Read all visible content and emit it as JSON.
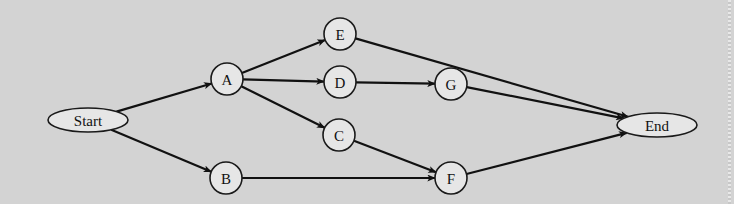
{
  "diagram": {
    "type": "network-precedence-diagram",
    "nodes": [
      {
        "id": "Start",
        "label": "Start",
        "shape": "ellipse",
        "cx": 88,
        "cy": 120,
        "rx": 40,
        "ry": 12
      },
      {
        "id": "A",
        "label": "A",
        "shape": "circle",
        "cx": 227,
        "cy": 79,
        "r": 16
      },
      {
        "id": "B",
        "label": "B",
        "shape": "circle",
        "cx": 226,
        "cy": 178,
        "r": 16
      },
      {
        "id": "E",
        "label": "E",
        "shape": "circle",
        "cx": 340,
        "cy": 34,
        "r": 16
      },
      {
        "id": "D",
        "label": "D",
        "shape": "circle",
        "cx": 340,
        "cy": 82,
        "r": 16
      },
      {
        "id": "C",
        "label": "C",
        "shape": "circle",
        "cx": 339,
        "cy": 135,
        "r": 16
      },
      {
        "id": "G",
        "label": "G",
        "shape": "circle",
        "cx": 451,
        "cy": 84,
        "r": 16
      },
      {
        "id": "F",
        "label": "F",
        "shape": "circle",
        "cx": 451,
        "cy": 178,
        "r": 16
      },
      {
        "id": "End",
        "label": "End",
        "shape": "ellipse",
        "cx": 657,
        "cy": 125,
        "rx": 40,
        "ry": 12
      }
    ],
    "edges": [
      {
        "from": "Start",
        "to": "A"
      },
      {
        "from": "Start",
        "to": "B"
      },
      {
        "from": "A",
        "to": "E"
      },
      {
        "from": "A",
        "to": "D"
      },
      {
        "from": "A",
        "to": "C"
      },
      {
        "from": "D",
        "to": "G"
      },
      {
        "from": "C",
        "to": "F"
      },
      {
        "from": "B",
        "to": "F"
      },
      {
        "from": "E",
        "to": "End"
      },
      {
        "from": "G",
        "to": "End"
      },
      {
        "from": "F",
        "to": "End"
      }
    ]
  },
  "colors": {
    "background": "#d3d3d3",
    "node_fill": "#e6e6e6",
    "stroke": "#111111"
  }
}
